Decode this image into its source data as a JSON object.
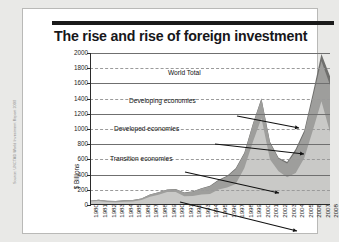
{
  "card": {
    "title": "The rise and rise of foreign investment",
    "source": "Source: UNCTAD World Investment Report 2009"
  },
  "chart_data": {
    "type": "area",
    "title": "The rise and rise of foreign investment",
    "xlabel": "",
    "ylabel": "$ Billions",
    "ylim": [
      0,
      2000
    ],
    "ytick_step": 200,
    "yticks": [
      "2000",
      "1800",
      "1600",
      "1400",
      "1200",
      "1000",
      "800",
      "600",
      "400",
      "200",
      "0"
    ],
    "grid": true,
    "stacked": true,
    "legend": "annotations",
    "categories": [
      "1980",
      "1981",
      "1982",
      "1983",
      "1984",
      "1985",
      "1986",
      "1987",
      "1988",
      "1989",
      "1990",
      "1991",
      "1992",
      "1993",
      "1994",
      "1995",
      "1996",
      "1997",
      "1998",
      "1999",
      "2000",
      "2001",
      "2002",
      "2003",
      "2004",
      "2005",
      "2006",
      "2007",
      "2008"
    ],
    "series": [
      {
        "name": "Developed economies",
        "color": "#c9c9c7",
        "values": [
          46,
          52,
          38,
          35,
          42,
          45,
          65,
          110,
          135,
          170,
          172,
          115,
          120,
          138,
          146,
          205,
          230,
          275,
          485,
          830,
          1140,
          600,
          445,
          365,
          420,
          620,
          985,
          1365,
          960
        ]
      },
      {
        "name": "Developing economies",
        "color": "#9e9e9c",
        "values": [
          9,
          16,
          18,
          18,
          19,
          21,
          21,
          28,
          33,
          32,
          36,
          45,
          55,
          78,
          102,
          118,
          145,
          195,
          190,
          230,
          255,
          220,
          165,
          180,
          285,
          330,
          430,
          530,
          620
        ]
      },
      {
        "name": "Transition economies",
        "color": "#6f6f6d",
        "values": [
          0,
          0,
          0,
          0,
          0,
          0,
          0,
          0,
          0,
          2,
          3,
          4,
          5,
          6,
          6,
          8,
          10,
          12,
          11,
          10,
          9,
          11,
          12,
          20,
          31,
          31,
          57,
          91,
          114
        ]
      }
    ],
    "total_name": "World Total",
    "annotations": [
      {
        "label": "World Total"
      },
      {
        "label": "Developing economies"
      },
      {
        "label": "Developed economies"
      },
      {
        "label": "Transition economies"
      }
    ]
  }
}
